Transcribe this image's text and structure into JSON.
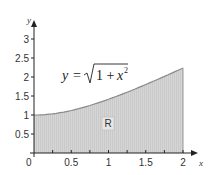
{
  "chart_data": {
    "type": "area",
    "title": "",
    "xlabel": "x",
    "ylabel": "y",
    "function": "y = sqrt(1 + x^2)",
    "x": [
      0,
      0.25,
      0.5,
      0.75,
      1,
      1.25,
      1.5,
      1.75,
      2
    ],
    "values": [
      1,
      1.031,
      1.118,
      1.25,
      1.414,
      1.601,
      1.803,
      2.016,
      2.236
    ],
    "xlim": [
      0,
      2
    ],
    "ylim": [
      0,
      3
    ],
    "x_ticks": [
      "0",
      "0.5",
      "1",
      "1.5",
      "2"
    ],
    "y_ticks": [
      "0.5",
      "1",
      "1.5",
      "2",
      "2.5",
      "3"
    ],
    "grid": false,
    "region_label": "R",
    "annotation": {
      "lhs": "y",
      "eq": "=",
      "radicand_1": "1 +",
      "radicand_x": "x",
      "exp": "2"
    },
    "fill_color": "#d3d3d3",
    "curve_color": "#888888"
  }
}
